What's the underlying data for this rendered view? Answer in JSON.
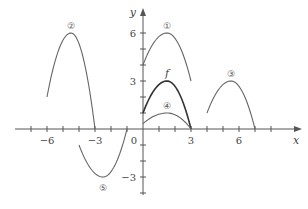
{
  "chart_data": {
    "type": "line",
    "title": "",
    "xlabel": "x",
    "ylabel": "y",
    "xlim": [
      -7.5,
      8.5
    ],
    "ylim": [
      -4,
      7
    ],
    "grid": false,
    "legend": "none",
    "x_ticks": [
      -6,
      -3,
      0,
      3,
      6
    ],
    "x_tick_labels": [
      "−6",
      "−3",
      "0",
      "3",
      "6"
    ],
    "y_ticks": [
      6,
      3,
      -3
    ],
    "y_tick_labels": [
      "6",
      "3",
      "−3"
    ],
    "series": [
      {
        "name": "f",
        "label": "f",
        "points": [
          [
            0,
            1
          ],
          [
            1.5,
            3
          ],
          [
            3,
            0
          ]
        ]
      },
      {
        "name": "curve-1",
        "label": "①",
        "points": [
          [
            0,
            4
          ],
          [
            1.5,
            6
          ],
          [
            3,
            3
          ]
        ]
      },
      {
        "name": "curve-2",
        "label": "②",
        "points": [
          [
            -6,
            2
          ],
          [
            -4.5,
            6
          ],
          [
            -3,
            0
          ]
        ]
      },
      {
        "name": "curve-3",
        "label": "③",
        "points": [
          [
            4,
            1
          ],
          [
            5.5,
            3
          ],
          [
            7,
            0
          ]
        ]
      },
      {
        "name": "curve-4",
        "label": "④",
        "points": [
          [
            0,
            0.333
          ],
          [
            1.5,
            1
          ],
          [
            3,
            0
          ]
        ]
      },
      {
        "name": "curve-5",
        "label": "⑤",
        "points": [
          [
            -4,
            -1
          ],
          [
            -2.5,
            -3
          ],
          [
            -1,
            0
          ]
        ]
      }
    ]
  }
}
